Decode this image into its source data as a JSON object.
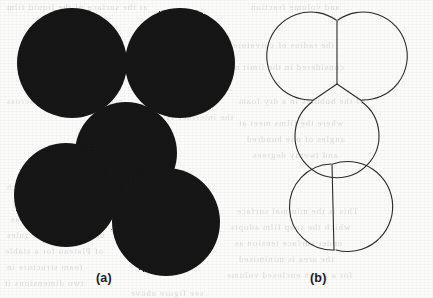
{
  "figure": {
    "background_color": "#fcfcfb",
    "ink_color": "#1a1a1a",
    "outline_color": "#2b2b2b",
    "panels": [
      {
        "id": "panel-a",
        "caption": "(a)",
        "style": "filled-silhouette",
        "description": "Black filled soap-bubble clusters"
      },
      {
        "id": "panel-b",
        "caption": "(b)",
        "style": "outline",
        "description": "Outline of the same clusters showing Plateau border junctions"
      }
    ],
    "clusters": [
      {
        "id": "triple-cluster",
        "bubble_count": 3,
        "junction_angle_degrees": 120,
        "bubbles": [
          {
            "label": "left",
            "cx": 72,
            "cy": 63,
            "r": 55
          },
          {
            "label": "right",
            "cx": 180,
            "cy": 63,
            "r": 55
          },
          {
            "label": "lower",
            "cx": 126,
            "cy": 153,
            "r": 51
          }
        ]
      },
      {
        "id": "double-cluster",
        "bubble_count": 2,
        "junction_angle_degrees": 120,
        "bubbles": [
          {
            "label": "upper-left",
            "cx": 66,
            "cy": 195,
            "r": 52
          },
          {
            "label": "lower-right",
            "cx": 166,
            "cy": 222,
            "r": 54
          }
        ]
      }
    ]
  },
  "captions": {
    "a": "(a)",
    "b": "(b)"
  },
  "ghost_text": {
    "note": "Faint mirrored text bleeding through the scanned page",
    "lines": [
      {
        "text": "at the surface of the liquid film",
        "x": 6,
        "y": 2,
        "size": 9
      },
      {
        "text": "and volume fraction",
        "x": 250,
        "y": 2,
        "size": 9
      },
      {
        "text": "is not",
        "x": 176,
        "y": 38,
        "size": 9
      },
      {
        "text": "the radius of curvature",
        "x": 232,
        "y": 40,
        "size": 9
      },
      {
        "text": "considered in the limit of",
        "x": 230,
        "y": 62,
        "size": 9
      },
      {
        "text": "pressure difference across",
        "x": 6,
        "y": 96,
        "size": 9
      },
      {
        "text": "the interface is given by",
        "x": 124,
        "y": 112,
        "size": 9
      },
      {
        "text": "of the bubbles in a dry foam",
        "x": 238,
        "y": 96,
        "size": 9
      },
      {
        "text": "where the films meet at",
        "x": 238,
        "y": 118,
        "size": 9
      },
      {
        "text": "angles of one hundred",
        "x": 246,
        "y": 134,
        "size": 9
      },
      {
        "text": "and twenty degrees",
        "x": 252,
        "y": 150,
        "size": 9
      },
      {
        "text": "equal tension in each",
        "x": 6,
        "y": 182,
        "size": 9
      },
      {
        "text": "film meeting along",
        "x": 12,
        "y": 198,
        "size": 9
      },
      {
        "text": "a Plateau border as",
        "x": 10,
        "y": 214,
        "size": 9
      },
      {
        "text": "described by the rules",
        "x": 6,
        "y": 230,
        "size": 9
      },
      {
        "text": "of Plateau for a stable",
        "x": 4,
        "y": 246,
        "size": 9
      },
      {
        "text": "foam structure in",
        "x": 6,
        "y": 262,
        "size": 9
      },
      {
        "text": "two dimensions it",
        "x": 4,
        "y": 278,
        "size": 9
      },
      {
        "text": "This is the minimal surface",
        "x": 236,
        "y": 206,
        "size": 9
      },
      {
        "text": "which the soap film adopts",
        "x": 230,
        "y": 222,
        "size": 9
      },
      {
        "text": "under surface tension as",
        "x": 234,
        "y": 238,
        "size": 9
      },
      {
        "text": "the area is minimised",
        "x": 238,
        "y": 254,
        "size": 9
      },
      {
        "text": "for a given enclosed volume",
        "x": 226,
        "y": 270,
        "size": 9
      },
      {
        "text": "see figure above",
        "x": 130,
        "y": 288,
        "size": 9
      }
    ]
  }
}
